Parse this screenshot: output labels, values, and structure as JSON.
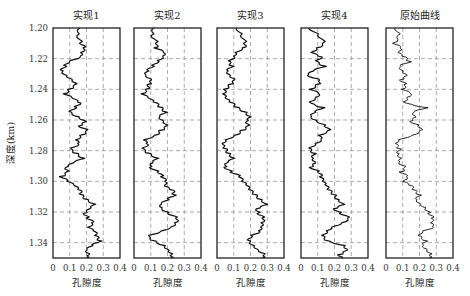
{
  "chart_data": {
    "type": "line",
    "orientation": "vertical-log",
    "ylabel": "深度(km)",
    "ylim": [
      1.2,
      1.35
    ],
    "yticks": [
      "1.20",
      "1.22",
      "1.24",
      "1.26",
      "1.28",
      "1.30",
      "1.32",
      "1.34"
    ],
    "xlim": [
      0,
      0.4
    ],
    "xticks": [
      "0",
      "0.1",
      "0.2",
      "0.3",
      "0.4"
    ],
    "grid": true,
    "grid_style": "dashed",
    "panels": [
      {
        "title": "实现1",
        "xlabel": "孔隙度",
        "depth": [
          1.2,
          1.205,
          1.21,
          1.213,
          1.216,
          1.219,
          1.222,
          1.225,
          1.228,
          1.231,
          1.234,
          1.237,
          1.24,
          1.243,
          1.246,
          1.249,
          1.252,
          1.255,
          1.258,
          1.261,
          1.264,
          1.267,
          1.27,
          1.273,
          1.276,
          1.279,
          1.282,
          1.285,
          1.288,
          1.291,
          1.294,
          1.297,
          1.3,
          1.303,
          1.306,
          1.309,
          1.312,
          1.315,
          1.318,
          1.321,
          1.324,
          1.327,
          1.33,
          1.333,
          1.336,
          1.339,
          1.342,
          1.345,
          1.348,
          1.35
        ],
        "porosity": [
          0.16,
          0.15,
          0.17,
          0.19,
          0.17,
          0.16,
          0.09,
          0.07,
          0.05,
          0.08,
          0.12,
          0.14,
          0.1,
          0.07,
          0.12,
          0.16,
          0.13,
          0.1,
          0.15,
          0.2,
          0.16,
          0.21,
          0.17,
          0.14,
          0.15,
          0.1,
          0.14,
          0.18,
          0.12,
          0.08,
          0.09,
          0.05,
          0.09,
          0.13,
          0.16,
          0.17,
          0.2,
          0.25,
          0.22,
          0.19,
          0.21,
          0.24,
          0.21,
          0.25,
          0.26,
          0.28,
          0.23,
          0.2,
          0.22,
          0.2
        ]
      },
      {
        "title": "实现2",
        "xlabel": "孔隙度",
        "depth": [
          1.2,
          1.205,
          1.21,
          1.213,
          1.216,
          1.219,
          1.222,
          1.225,
          1.228,
          1.231,
          1.234,
          1.237,
          1.24,
          1.243,
          1.246,
          1.249,
          1.252,
          1.255,
          1.258,
          1.261,
          1.264,
          1.267,
          1.27,
          1.273,
          1.276,
          1.279,
          1.282,
          1.285,
          1.288,
          1.291,
          1.294,
          1.297,
          1.3,
          1.303,
          1.306,
          1.309,
          1.312,
          1.315,
          1.318,
          1.321,
          1.324,
          1.327,
          1.33,
          1.333,
          1.336,
          1.339,
          1.342,
          1.345,
          1.348,
          1.35
        ],
        "porosity": [
          0.12,
          0.11,
          0.14,
          0.13,
          0.18,
          0.17,
          0.14,
          0.11,
          0.08,
          0.07,
          0.11,
          0.09,
          0.08,
          0.05,
          0.09,
          0.13,
          0.16,
          0.19,
          0.15,
          0.18,
          0.2,
          0.16,
          0.13,
          0.06,
          0.08,
          0.05,
          0.09,
          0.14,
          0.11,
          0.1,
          0.15,
          0.17,
          0.19,
          0.18,
          0.23,
          0.24,
          0.2,
          0.16,
          0.17,
          0.21,
          0.26,
          0.25,
          0.22,
          0.15,
          0.08,
          0.12,
          0.18,
          0.21,
          0.23,
          0.22
        ]
      },
      {
        "title": "实现3",
        "xlabel": "孔隙度",
        "depth": [
          1.2,
          1.205,
          1.21,
          1.213,
          1.216,
          1.219,
          1.222,
          1.225,
          1.228,
          1.231,
          1.234,
          1.237,
          1.24,
          1.243,
          1.246,
          1.249,
          1.252,
          1.255,
          1.258,
          1.261,
          1.264,
          1.267,
          1.27,
          1.273,
          1.276,
          1.279,
          1.282,
          1.285,
          1.288,
          1.291,
          1.294,
          1.297,
          1.3,
          1.303,
          1.306,
          1.309,
          1.312,
          1.315,
          1.318,
          1.321,
          1.324,
          1.327,
          1.33,
          1.333,
          1.336,
          1.339,
          1.342,
          1.345,
          1.348,
          1.35
        ],
        "porosity": [
          0.12,
          0.15,
          0.17,
          0.16,
          0.11,
          0.1,
          0.07,
          0.09,
          0.06,
          0.08,
          0.11,
          0.08,
          0.05,
          0.04,
          0.05,
          0.09,
          0.12,
          0.17,
          0.2,
          0.18,
          0.19,
          0.15,
          0.11,
          0.05,
          0.03,
          0.05,
          0.07,
          0.1,
          0.06,
          0.05,
          0.09,
          0.14,
          0.15,
          0.18,
          0.2,
          0.23,
          0.26,
          0.3,
          0.24,
          0.25,
          0.28,
          0.27,
          0.26,
          0.25,
          0.2,
          0.19,
          0.22,
          0.25,
          0.29,
          0.27
        ]
      },
      {
        "title": "实现4",
        "xlabel": "孔隙度",
        "depth": [
          1.2,
          1.205,
          1.21,
          1.213,
          1.216,
          1.219,
          1.222,
          1.225,
          1.228,
          1.231,
          1.234,
          1.237,
          1.24,
          1.243,
          1.246,
          1.249,
          1.252,
          1.255,
          1.258,
          1.261,
          1.264,
          1.267,
          1.27,
          1.273,
          1.276,
          1.279,
          1.282,
          1.285,
          1.288,
          1.291,
          1.294,
          1.297,
          1.3,
          1.303,
          1.306,
          1.309,
          1.312,
          1.315,
          1.318,
          1.321,
          1.324,
          1.327,
          1.33,
          1.333,
          1.336,
          1.339,
          1.342,
          1.345,
          1.348,
          1.35
        ],
        "porosity": [
          0.05,
          0.11,
          0.14,
          0.1,
          0.06,
          0.12,
          0.09,
          0.14,
          0.07,
          0.04,
          0.12,
          0.1,
          0.06,
          0.11,
          0.08,
          0.05,
          0.13,
          0.08,
          0.06,
          0.1,
          0.15,
          0.17,
          0.11,
          0.12,
          0.08,
          0.05,
          0.08,
          0.07,
          0.09,
          0.06,
          0.11,
          0.12,
          0.13,
          0.15,
          0.17,
          0.2,
          0.22,
          0.26,
          0.2,
          0.24,
          0.29,
          0.25,
          0.18,
          0.15,
          0.13,
          0.16,
          0.26,
          0.28,
          0.23,
          0.24
        ]
      },
      {
        "title": "原始曲线",
        "xlabel": "孔隙度",
        "depth": [
          1.2,
          1.205,
          1.21,
          1.213,
          1.216,
          1.219,
          1.222,
          1.225,
          1.228,
          1.231,
          1.234,
          1.237,
          1.24,
          1.243,
          1.246,
          1.249,
          1.252,
          1.255,
          1.258,
          1.261,
          1.264,
          1.267,
          1.27,
          1.273,
          1.276,
          1.279,
          1.282,
          1.285,
          1.288,
          1.291,
          1.294,
          1.297,
          1.3,
          1.303,
          1.306,
          1.309,
          1.312,
          1.315,
          1.318,
          1.321,
          1.324,
          1.327,
          1.33,
          1.333,
          1.336,
          1.339,
          1.342,
          1.345,
          1.348,
          1.35
        ],
        "porosity": [
          0.06,
          0.08,
          0.05,
          0.09,
          0.07,
          0.11,
          0.14,
          0.08,
          0.1,
          0.13,
          0.09,
          0.12,
          0.1,
          0.15,
          0.12,
          0.11,
          0.24,
          0.16,
          0.18,
          0.15,
          0.2,
          0.21,
          0.16,
          0.07,
          0.06,
          0.08,
          0.07,
          0.09,
          0.08,
          0.12,
          0.09,
          0.13,
          0.1,
          0.15,
          0.17,
          0.2,
          0.18,
          0.21,
          0.24,
          0.26,
          0.28,
          0.27,
          0.28,
          0.21,
          0.2,
          0.24,
          0.22,
          0.25,
          0.27,
          0.26
        ]
      }
    ]
  }
}
